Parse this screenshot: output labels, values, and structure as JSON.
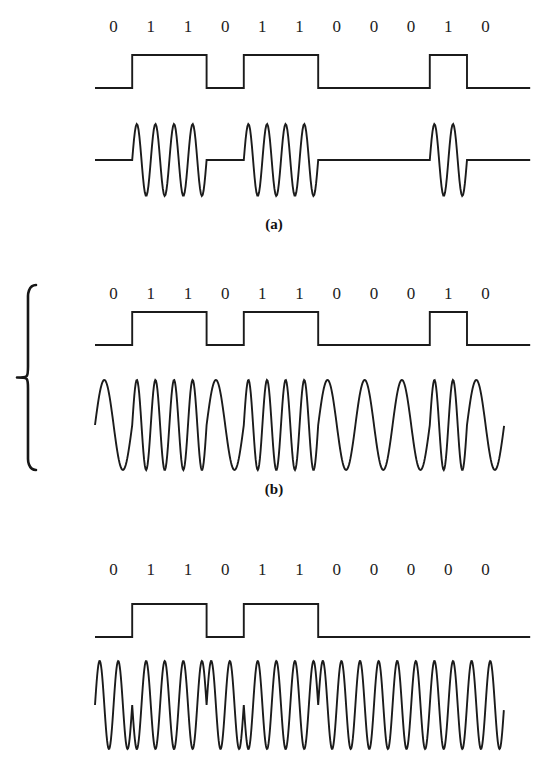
{
  "figure": {
    "background_color": "#ffffff",
    "ink_color": "#1b1b1b",
    "panels": [
      {
        "id": "ask",
        "label": "(a)",
        "modulation": "ASK",
        "bits": [
          "0",
          "1",
          "1",
          "0",
          "1",
          "1",
          "0",
          "0",
          "0",
          "1",
          "0"
        ],
        "digits_text": "0 1 1 0 1 1 0 0 0 1 0",
        "bit_row_y": 14,
        "square": {
          "x_start": 95,
          "bit_width": 37.2,
          "baseline_y": 88,
          "high_y": 55
        },
        "carrier": {
          "y_center": 160,
          "amplitude": 36,
          "cycles_per_bit": 2,
          "baseline_y": 160,
          "type": "amplitude-shift-keying",
          "note": "carrier burst during 1 bits, flat line during 0 bits"
        },
        "label_y": 216
      },
      {
        "id": "fsk",
        "label": "(b)",
        "modulation": "FSK",
        "bits": [
          "0",
          "1",
          "1",
          "0",
          "1",
          "1",
          "0",
          "0",
          "0",
          "1",
          "0"
        ],
        "digits_text": "0 1 1 0 1 1 0 0 0 1 0",
        "bit_row_y": 281,
        "square": {
          "x_start": 95,
          "bit_width": 37.2,
          "baseline_y": 345,
          "high_y": 312
        },
        "carrier": {
          "y_center": 425,
          "amplitude": 45,
          "cycles_per_bit_zero": 1,
          "cycles_per_bit_one": 2,
          "type": "frequency-shift-keying",
          "note": "continuous wave; high frequency for 1, low frequency for 0"
        },
        "label_y": 481,
        "brace": {
          "x": 28,
          "y_top": 285,
          "y_bottom": 470
        }
      },
      {
        "id": "psk",
        "label": "(c)",
        "modulation": "PSK",
        "bits": [
          "0",
          "1",
          "1",
          "0",
          "1",
          "1",
          "0",
          "0",
          "0",
          "0",
          "0"
        ],
        "digits_text": "0 1 1 0 1 1 0 0 0 0 0",
        "bit_row_y": 557,
        "square": {
          "x_start": 95,
          "bit_width": 37.2,
          "baseline_y": 637,
          "high_y": 604
        },
        "carrier": {
          "y_center": 705,
          "amplitude": 44,
          "cycles_per_bit": 2,
          "type": "phase-shift-keying",
          "note": "constant amplitude and frequency; 180 degree phase reversal at bit changes"
        }
      }
    ]
  }
}
